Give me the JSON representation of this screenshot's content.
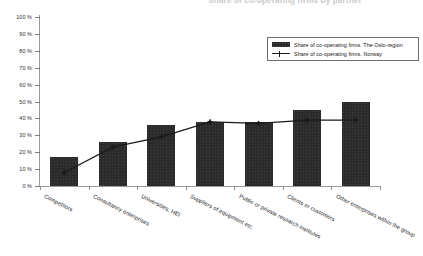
{
  "chart_data": {
    "type": "bar",
    "title": "Share of co-operating firms by partner",
    "xlabel": "",
    "ylabel": "",
    "ylim": [
      0,
      100
    ],
    "ytick_labels": [
      "100 %",
      "90 %",
      "80 %",
      "70 %",
      "60 %",
      "50 %",
      "40 %",
      "30 %",
      "20 %",
      "10 %",
      "0 %"
    ],
    "ytick_values": [
      100,
      90,
      80,
      70,
      60,
      50,
      40,
      30,
      20,
      10,
      0
    ],
    "grid": false,
    "legend_position": "upper right",
    "categories": [
      "Competitors",
      "Consultancy enterprises",
      "Universities, HEI",
      "Suppliers of equipment etc.",
      "Public or private research institutes",
      "Clients or customers",
      "Other enterprises within the group"
    ],
    "series": [
      {
        "name": "Share of co-operating firms. The Oslo-region",
        "type": "bar",
        "values": [
          17,
          26,
          36,
          38,
          38,
          45,
          50
        ]
      },
      {
        "name": "Share of co-operating firms. Norway",
        "type": "line",
        "values": [
          8,
          23,
          29,
          38,
          37,
          39,
          39
        ]
      }
    ]
  },
  "legend": {
    "entries": [
      {
        "label": "Share of co-operating firms. The Oslo-region",
        "marker": "filled-rect-swatch"
      },
      {
        "label": "Share of co-operating firms. Norway",
        "marker": "line-with-plus-marker"
      }
    ]
  },
  "axes": {
    "y_labels": [
      "100 %",
      "90 %",
      "80 %",
      "70 %",
      "60 %",
      "50 %",
      "40 %",
      "30 %",
      "20 %",
      "10 %",
      "0 %"
    ],
    "x_labels": [
      "Competitors",
      "Consultancy enterprises",
      "Universities, HEI",
      "Suppliers of equipment etc.",
      "Public or private research institutes",
      "Clients or customers",
      "Other enterprises within the group"
    ]
  },
  "colors": {
    "bar": "#2b2b2b",
    "line": "#1a1a1a",
    "axis": "#9a9a9a",
    "text": "#121212",
    "background": "#ffffff"
  }
}
